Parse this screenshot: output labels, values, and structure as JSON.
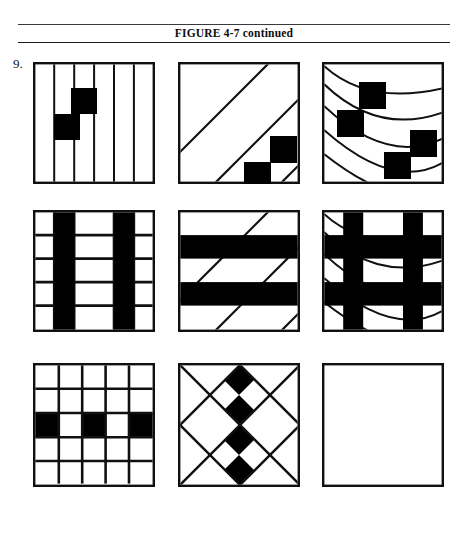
{
  "header": {
    "caption": "FIGURE 4-7 continued",
    "rule_color": "#1a1a1a"
  },
  "item": {
    "number": "9."
  },
  "palette": {
    "ink": "#101010",
    "fill_black": "#000000",
    "paper": "#ffffff"
  },
  "puzzle": {
    "type": "matrix-reasoning-3x3",
    "cell_size": 122,
    "rows": 3,
    "columns": 3,
    "cells": [
      {
        "id": "r1c1",
        "row": 1,
        "col": 1,
        "name": "vertical-stripes-with-two-squares",
        "pattern": "vertical-lines",
        "line_count": 6,
        "marks": 2,
        "mark_shape": "filled-square",
        "mark_positions": [
          [
            0.42,
            0.27
          ],
          [
            0.28,
            0.5
          ]
        ],
        "mark_size": 0.21
      },
      {
        "id": "r1c2",
        "row": 1,
        "col": 2,
        "name": "diagonal-stripes-with-two-squares",
        "pattern": "diagonal-lines-up-right",
        "line_count": 5,
        "marks": 2,
        "mark_shape": "filled-square",
        "mark_positions": [
          [
            0.78,
            0.68
          ],
          [
            0.57,
            0.84
          ]
        ],
        "mark_size": 0.21
      },
      {
        "id": "r1c3",
        "row": 1,
        "col": 3,
        "name": "nested-arcs-with-four-squares",
        "pattern": "concentric-arcs",
        "line_count": 5,
        "marks": 4,
        "mark_shape": "filled-square",
        "mark_positions": [
          [
            0.4,
            0.22
          ],
          [
            0.22,
            0.45
          ],
          [
            0.78,
            0.62
          ],
          [
            0.57,
            0.8
          ]
        ],
        "mark_size": 0.21
      },
      {
        "id": "r2c1",
        "row": 2,
        "col": 1,
        "name": "vertical-stripes-with-black-columns",
        "pattern": "vertical-lines",
        "line_count": 6,
        "filled": "columns-2-and-5",
        "grid_rows": 5
      },
      {
        "id": "r2c2",
        "row": 2,
        "col": 2,
        "name": "diagonal-stripes-with-black-bands",
        "pattern": "diagonal-lines-up-right",
        "line_count": 5,
        "filled": "horizontal-bands-2-and-4",
        "grid_rows": 5
      },
      {
        "id": "r2c3",
        "row": 2,
        "col": 3,
        "name": "nested-arcs-with-black-grid",
        "pattern": "concentric-arcs",
        "line_count": 5,
        "filled": "cross-bands-rows-and-columns",
        "grid_rows": 5
      },
      {
        "id": "r3c1",
        "row": 3,
        "col": 1,
        "name": "five-by-five-grid-with-black-middle-row",
        "pattern": "square-grid",
        "grid_rows": 5,
        "grid_cols": 5,
        "filled_cells": [
          [
            3,
            1
          ],
          [
            3,
            3
          ],
          [
            3,
            5
          ]
        ]
      },
      {
        "id": "r3c2",
        "row": 3,
        "col": 2,
        "name": "diamond-lattice-with-black-center-column",
        "pattern": "diamond-lattice",
        "grid_rows": 4,
        "grid_cols": 4,
        "filled_diamonds": 4
      },
      {
        "id": "r3c3",
        "row": 3,
        "col": 3,
        "name": "empty-answer-box",
        "pattern": "empty",
        "is_answer_slot": true
      }
    ]
  }
}
